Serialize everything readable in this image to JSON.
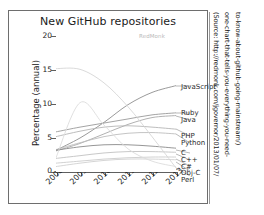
{
  "figure": {
    "title": "New GitHub repositories",
    "watermark": "RedMonk",
    "border_color": "#6e6e6e"
  },
  "source_caption": {
    "line1": "(Source: http://redmonk.com/jgovernor/2013/01/07/",
    "line2": "one-chart-that-tells-you-everything-you-need-",
    "line3": "to-know-about-github-going-mainstream/)"
  },
  "chart_data": {
    "type": "line",
    "title": "New GitHub repositories",
    "xlabel": "",
    "ylabel": "Percentage (annual)",
    "x": [
      2008,
      2009,
      2010,
      2011,
      2012,
      2013
    ],
    "xticklabels": [
      "2008",
      "2009",
      "2010",
      "2011",
      "2012",
      "2013"
    ],
    "yticklabels": [
      "0",
      "5",
      "10",
      "15",
      "20"
    ],
    "yticks": [
      0,
      5,
      10,
      15,
      20
    ],
    "ylim": [
      0,
      20
    ],
    "xlim": [
      2008,
      2013
    ],
    "grid": false,
    "legend": "right-edge-series-labels",
    "series": [
      {
        "name": "JavaScript",
        "color": "#8f8f8f",
        "values": [
          3.2,
          5.0,
          7.3,
          9.9,
          11.7,
          12.7
        ]
      },
      {
        "name": "Ruby",
        "color": "#9a9a9a",
        "values": [
          5.9,
          6.6,
          7.2,
          7.8,
          8.4,
          8.7
        ]
      },
      {
        "name": "Java",
        "color": "#a8a8a8",
        "values": [
          3.1,
          4.2,
          5.6,
          7.0,
          8.0,
          8.3
        ]
      },
      {
        "name": "PHP",
        "color": "#b5b5b5",
        "values": [
          5.2,
          6.0,
          6.6,
          6.8,
          6.6,
          6.3
        ]
      },
      {
        "name": "Python",
        "color": "#bdbdbd",
        "values": [
          3.3,
          4.3,
          5.2,
          5.7,
          5.8,
          5.6
        ]
      },
      {
        "name": "C",
        "color": "#8a8a8a",
        "values": [
          3.2,
          3.7,
          4.0,
          4.0,
          3.8,
          3.5
        ]
      },
      {
        "name": "C++",
        "color": "#c2c2c2",
        "values": [
          2.0,
          2.4,
          2.8,
          3.0,
          3.0,
          2.9
        ]
      },
      {
        "name": "C#",
        "color": "#cccccc",
        "values": [
          1.3,
          1.6,
          1.9,
          2.1,
          2.2,
          2.2
        ]
      },
      {
        "name": "Obj-C",
        "color": "#d0d0d0",
        "values": [
          0.8,
          1.3,
          1.7,
          1.9,
          1.9,
          1.8
        ]
      },
      {
        "name": "Perl",
        "color": "#d6d6d6",
        "values": [
          15.2,
          15.1,
          13.1,
          9.6,
          5.2,
          0.6
        ]
      },
      {
        "name": "peak-series",
        "color": "#dcdcdc",
        "values": [
          2.1,
          10.2,
          6.9,
          3.4,
          1.6,
          0.8
        ]
      }
    ],
    "series_labels": [
      {
        "name": "JavaScript",
        "y_value": 12.7
      },
      {
        "name": "Ruby",
        "y_value": 8.7
      },
      {
        "name": "Java",
        "y_value": 8.3
      },
      {
        "name": "PHP",
        "y_value": 6.3
      },
      {
        "name": "Python",
        "y_value": 5.6
      },
      {
        "name": "C",
        "y_value": 3.5
      },
      {
        "name": "C++",
        "y_value": 2.9
      },
      {
        "name": "C#",
        "y_value": 2.2
      },
      {
        "name": "Obj-C",
        "y_value": 1.8
      },
      {
        "name": "Perl",
        "y_value": 0.6
      }
    ]
  }
}
